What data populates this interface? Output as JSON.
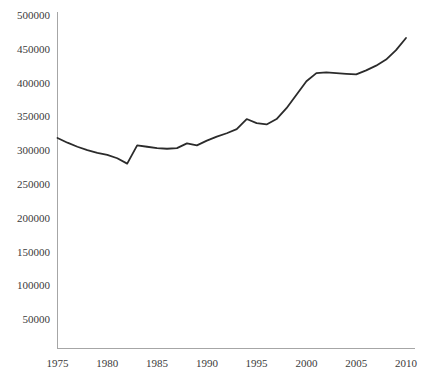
{
  "chart_data": {
    "type": "line",
    "title": "",
    "subtitle": "",
    "xlabel": "",
    "ylabel": "",
    "xlim": [
      1974,
      2011
    ],
    "ylim": [
      0,
      500000
    ],
    "grid": false,
    "legend": null,
    "legend_position": "none",
    "line_color": "#2b2b2b",
    "axis_color": "#a6a6a6",
    "x_ticks": [
      1975,
      1980,
      1985,
      1990,
      1995,
      2000,
      2005,
      2010
    ],
    "x_tick_labels": [
      "1975",
      "1980",
      "1985",
      "1990",
      "1995",
      "2000",
      "2005",
      "2010"
    ],
    "y_ticks": [
      50000,
      100000,
      150000,
      200000,
      250000,
      300000,
      350000,
      400000,
      450000,
      500000
    ],
    "y_tick_labels": [
      "50000",
      "100000",
      "150000",
      "200000",
      "250000",
      "300000",
      "350000",
      "400000",
      "450000",
      "500000"
    ],
    "series": [
      {
        "name": "series-1",
        "x": [
          1975,
          1976,
          1977,
          1978,
          1979,
          1980,
          1981,
          1982,
          1983,
          1984,
          1985,
          1986,
          1987,
          1988,
          1989,
          1990,
          1991,
          1992,
          1993,
          1994,
          1995,
          1996,
          1997,
          1998,
          1999,
          2000,
          2001,
          2002,
          2003,
          2004,
          2005,
          2006,
          2007,
          2008,
          2009,
          2010
        ],
        "values": [
          318000,
          311000,
          305000,
          300000,
          296000,
          293000,
          288000,
          280000,
          307000,
          305000,
          303000,
          302000,
          303000,
          310000,
          307000,
          314000,
          320000,
          325000,
          331000,
          346000,
          340000,
          338000,
          346000,
          362000,
          382000,
          402000,
          414000,
          415000,
          414000,
          413000,
          412000,
          418000,
          425000,
          434000,
          448000,
          466000
        ]
      }
    ]
  }
}
